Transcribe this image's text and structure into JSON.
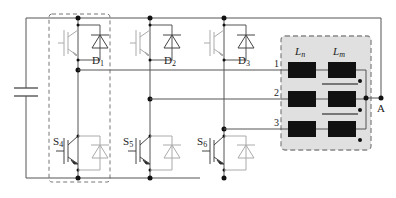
{
  "diagram": {
    "type": "three-leg inverter with coupled inductors",
    "upper_switches": [
      {
        "diode_label": "D",
        "diode_sub": "1",
        "active": false
      },
      {
        "diode_label": "D",
        "diode_sub": "2",
        "active": false
      },
      {
        "diode_label": "D",
        "diode_sub": "3",
        "active": false
      }
    ],
    "lower_switches": [
      {
        "switch_label": "S",
        "switch_sub": "4",
        "active": true
      },
      {
        "switch_label": "S",
        "switch_sub": "5",
        "active": true
      },
      {
        "switch_label": "S",
        "switch_sub": "6",
        "active": true
      }
    ],
    "phase_labels": [
      "1",
      "2",
      "3"
    ],
    "inductor_labels": {
      "leakage": {
        "main": "L",
        "sub": "n"
      },
      "magnetizing": {
        "main": "L",
        "sub": "m"
      }
    },
    "output_label": "A",
    "colors": {
      "wire": "#555555",
      "inactive": "#aaaaaa",
      "inductor": "#111111",
      "box_fill": "#e0e0e0",
      "box_border": "#888888"
    }
  }
}
